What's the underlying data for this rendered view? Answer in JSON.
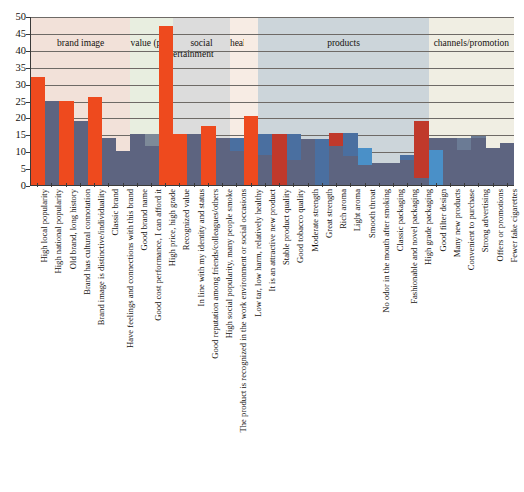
{
  "chart_data": {
    "type": "bar",
    "title": "",
    "xlabel": "",
    "ylabel": "",
    "ylim": [
      0,
      50
    ],
    "yticks": [
      0,
      5,
      10,
      15,
      20,
      25,
      30,
      35,
      40,
      45,
      50
    ],
    "grid": true,
    "legend": "none",
    "categories": [
      "High local popularity",
      "High national popularity",
      "Old brand, long history",
      "Brand has cultural connotation",
      "Brand image is distinctive/individuality",
      "Classic brand",
      "Have feelings and connections with this brand",
      "Good brand name",
      "Good cost performance, I can afford it",
      "High price, high grade",
      "Recognized value",
      "In line with my identity and status",
      "Good reputation among friends/colleagues/others",
      "High social popularity, many people smoke",
      "The product is recognized in the work environment or social occasions",
      "Low tar, low harm, relatively healthy",
      "It is an attractive new product",
      "Stable product quality",
      "Good tobacco quality",
      "Moderate strength",
      "Great strength",
      "Rich aroma",
      "Light aroma",
      "Smooth throat",
      "No odor in the mouth after smoking",
      "Classic packaging",
      "Fashionable and novel packaging",
      "High grade packaging",
      "Good filter design",
      "Many new products",
      "Convenient to purchase",
      "Strong advertising",
      "Offers or promotions",
      "Fewer fake cigarettes"
    ],
    "series": [
      {
        "name": "primary",
        "color": "#ee4a1e",
        "values": [
          32.0,
          25.0,
          25.0,
          19.0,
          26.0,
          14.0,
          10.0,
          15.0,
          15.0,
          47.0,
          15.0,
          15.0,
          17.5,
          14.0,
          14.0,
          20.5,
          15.0,
          15.0,
          15.0,
          13.5,
          13.5,
          15.5,
          15.5,
          11.0,
          6.5,
          6.5,
          9.0,
          19.0,
          10.5,
          14.0,
          14.0,
          14.5,
          11.0,
          12.5
        ]
      },
      {
        "name": "secondary",
        "color": "#5d6480",
        "values": [
          0.0,
          13.0,
          0.0,
          12.0,
          0.0,
          14.0,
          7.0,
          15.0,
          11.5,
          0.0,
          0.0,
          11.0,
          0.0,
          14.0,
          10.0,
          0.0,
          9.0,
          0.0,
          7.5,
          13.5,
          0.0,
          11.5,
          8.5,
          6.0,
          6.5,
          6.5,
          7.5,
          2.0,
          14.0,
          14.0,
          10.5,
          14.0,
          11.0,
          12.5
        ]
      }
    ],
    "bar_colors": [
      "#ee4a1e",
      "#5d6480",
      "#ee4a1e",
      "#5d6480",
      "#ee4a1e",
      "#5d6480",
      "#5d6480",
      "#7d8a99",
      "#7d8a99",
      "#ee4a1e",
      "#ee4a1e",
      "#5d6480",
      "#ee4a1e",
      "#4a6fa0",
      "#4a6fa0",
      "#ee4a1e",
      "#4a6fa0",
      "#c0392b",
      "#4a6fa0",
      "#4a6fa0",
      "#4a6fa0",
      "#c0392b",
      "#4a6fa0",
      "#4a90c8",
      "#4a6fa0",
      "#4a6fa0",
      "#4a6fa0",
      "#c0392b",
      "#4a90c8",
      "#2e5f9e",
      "#6b7b95",
      "#6b7b95",
      "#6b7b95",
      "#6b7b95"
    ],
    "bands": [
      {
        "label": "brand image",
        "label_top": "",
        "span": 7,
        "fill": "#f2e1d9"
      },
      {
        "label": "value (price)",
        "label_top": "",
        "span": 3,
        "fill": "#e8eee0"
      },
      {
        "label": "social",
        "label_top": "",
        "sublabel": "entertainment",
        "span": 4,
        "fill": "#dcdcdc"
      },
      {
        "label": "health",
        "label_top": "new products",
        "span": 1,
        "fill": "#f7ece4"
      },
      {
        "label": "",
        "label_top": "",
        "span": 1,
        "fill": "#f7ece4"
      },
      {
        "label": "products",
        "label_top": "",
        "span": 12,
        "fill": "#ccd5da"
      },
      {
        "label": "channels/promotion",
        "label_top": "",
        "span": 6,
        "fill": "#f0eee3"
      }
    ]
  },
  "axis": {
    "y_max_label": "50",
    "y_min_label": "0"
  }
}
